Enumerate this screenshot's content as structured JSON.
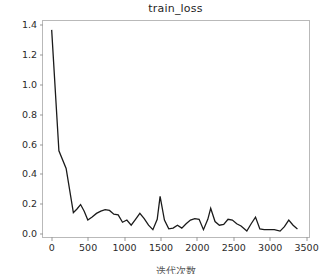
{
  "chart_data": {
    "type": "line",
    "title": "train_loss",
    "xlabel": "",
    "ylabel": "",
    "xlim": [
      -120,
      3560
    ],
    "ylim": [
      -0.035,
      1.43
    ],
    "grid": false,
    "legend": false,
    "line_color": "#1a1a1a",
    "line_width": 1.3,
    "xticks": [
      0,
      500,
      1000,
      1500,
      2000,
      2500,
      3000,
      3500
    ],
    "xticklabels": [
      "0",
      "500",
      "1000",
      "1500",
      "2000",
      "2500",
      "3000",
      "3500"
    ],
    "yticks": [
      0.0,
      0.2,
      0.4,
      0.6,
      0.8,
      1.0,
      1.2,
      1.4
    ],
    "yticklabels": [
      "0.0",
      "0.2",
      "0.4",
      "0.6",
      "0.8",
      "1.0",
      "1.2",
      "1.4"
    ],
    "series": [
      {
        "name": "train_loss",
        "x": [
          0,
          100,
          200,
          300,
          350,
          400,
          450,
          500,
          560,
          620,
          680,
          740,
          800,
          860,
          920,
          980,
          1040,
          1100,
          1160,
          1220,
          1280,
          1340,
          1400,
          1460,
          1500,
          1560,
          1620,
          1680,
          1740,
          1800,
          1860,
          1920,
          1980,
          2040,
          2100,
          2160,
          2200,
          2260,
          2320,
          2380,
          2440,
          2500,
          2560,
          2620,
          2700,
          2760,
          2820,
          2880,
          2940,
          3000,
          3080,
          3160,
          3220,
          3280,
          3340,
          3400
        ],
        "y": [
          1.37,
          0.55,
          0.43,
          0.13,
          0.155,
          0.185,
          0.14,
          0.08,
          0.1,
          0.125,
          0.14,
          0.15,
          0.145,
          0.12,
          0.115,
          0.065,
          0.08,
          0.045,
          0.085,
          0.125,
          0.09,
          0.045,
          0.015,
          0.085,
          0.24,
          0.08,
          0.02,
          0.025,
          0.045,
          0.025,
          0.055,
          0.08,
          0.09,
          0.085,
          0.015,
          0.085,
          0.16,
          0.07,
          0.045,
          0.05,
          0.085,
          0.08,
          0.055,
          0.04,
          0.005,
          0.055,
          0.1,
          0.02,
          0.015,
          0.015,
          0.015,
          0.005,
          0.035,
          0.08,
          0.045,
          0.02
        ]
      }
    ]
  },
  "figure": {
    "background_color": "#ffffff",
    "axes_edge_color": "#b9b9b9",
    "tick_color": "#9a9a9a",
    "text_color": "#2b2b2b",
    "bottom_caption": "迭代次数"
  }
}
